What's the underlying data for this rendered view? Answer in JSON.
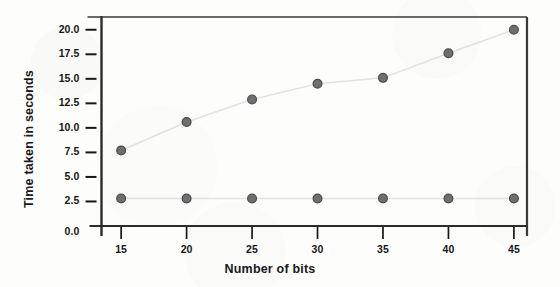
{
  "chart_data": {
    "type": "line",
    "title": "",
    "xlabel": "Number of bits",
    "ylabel": "Time  taken in seconds",
    "x": [
      15,
      20,
      25,
      30,
      35,
      40,
      45
    ],
    "categories": [
      "15",
      "20",
      "25",
      "30",
      "35",
      "40",
      "45"
    ],
    "xlim": [
      13.5,
      46.0
    ],
    "ylim": [
      0.0,
      21.3
    ],
    "xticks": [
      "15",
      "20",
      "25",
      "30",
      "35",
      "40",
      "45"
    ],
    "yticks": [
      "0.0",
      "2.5",
      "5.0",
      "7.5",
      "10.0",
      "12.5",
      "15.0",
      "17.5",
      "20.0"
    ],
    "ytick_values": [
      0.0,
      2.5,
      5.0,
      7.5,
      10.0,
      12.5,
      15.0,
      17.5,
      20.0
    ],
    "grid": false,
    "legend": "none",
    "series": [
      {
        "name": "rising-series",
        "values": [
          7.7,
          10.6,
          12.9,
          14.5,
          15.1,
          17.6,
          20.0
        ],
        "marker": "circle",
        "marker_color": "#6f6f6f",
        "marker_edge_color": "#4a4a4a",
        "line_color": "#e2e2e2"
      },
      {
        "name": "flat-series",
        "values": [
          2.8,
          2.8,
          2.8,
          2.8,
          2.8,
          2.8,
          2.8
        ],
        "marker": "circle",
        "marker_color": "#6f6f6f",
        "marker_edge_color": "#4a4a4a",
        "line_color": "#e4e4e4"
      }
    ],
    "colors": {
      "axis": "#2b2b2b",
      "frame": "#3a3a3a",
      "text": "#161616",
      "background": "#fdfdfc",
      "marker": "#6f6f6f",
      "line": "#e2e2e2"
    }
  }
}
